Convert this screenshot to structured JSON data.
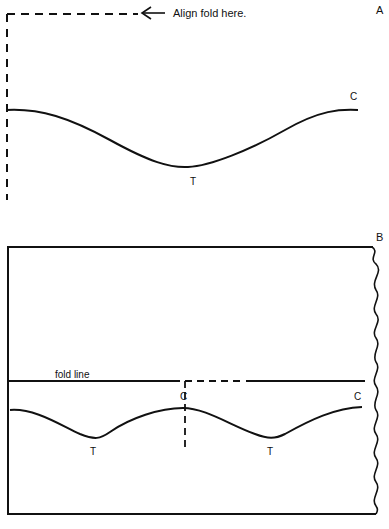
{
  "figure_a": {
    "panel_label": "A",
    "annotation": "Align fold here.",
    "crest_label": "C",
    "trough_label": "T"
  },
  "figure_b": {
    "panel_label": "B",
    "fold_label": "fold line",
    "crest_labels": [
      "C",
      "C"
    ],
    "trough_labels": [
      "T",
      "T"
    ]
  },
  "colors": {
    "ink": "#111111",
    "background": "#ffffff"
  }
}
